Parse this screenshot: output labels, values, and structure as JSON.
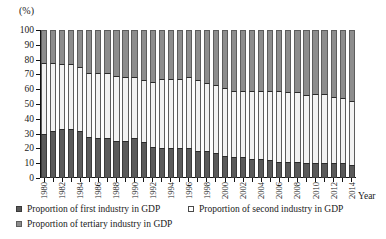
{
  "chart_data": {
    "type": "bar",
    "subtype": "100% stacked bar",
    "title": "",
    "xlabel": "Year",
    "ylabel": "(%)",
    "ylim": [
      0,
      100
    ],
    "yticks": [
      100,
      90,
      80,
      70,
      60,
      50,
      40,
      30,
      20,
      10,
      0
    ],
    "grid": false,
    "legend_position": "bottom",
    "x": [
      1980,
      1981,
      1982,
      1983,
      1984,
      1985,
      1986,
      1987,
      1988,
      1989,
      1990,
      1991,
      1992,
      1993,
      1994,
      1995,
      1996,
      1997,
      1998,
      1999,
      2000,
      2001,
      2002,
      2003,
      2004,
      2005,
      2006,
      2007,
      2008,
      2009,
      2010,
      2011,
      2012,
      2013,
      2014
    ],
    "tick_labels": [
      "1980",
      "1982",
      "1984",
      "1986",
      "1988",
      "1990",
      "1992",
      "1994",
      "1996",
      "1998",
      "2000",
      "2002",
      "2004",
      "2006",
      "2008",
      "2010",
      "2012",
      "2014"
    ],
    "tick_label_interval": 2,
    "series": [
      {
        "name": "Proportion of first industry in GDP",
        "color": "#5a5a5a",
        "values": [
          30,
          32,
          33,
          33,
          32,
          28,
          27,
          27,
          25,
          25,
          27,
          24,
          21,
          20,
          20,
          20,
          20,
          18,
          18,
          17,
          15,
          14,
          14,
          13,
          13,
          12,
          11,
          11,
          11,
          10,
          10,
          10,
          10,
          10,
          9
        ]
      },
      {
        "name": "Proportion of second industry in GDP",
        "color": "#f2f2f2",
        "values": [
          48,
          46,
          44,
          44,
          43,
          43,
          44,
          44,
          44,
          43,
          41,
          42,
          44,
          47,
          47,
          47,
          48,
          48,
          46,
          46,
          46,
          45,
          45,
          46,
          46,
          47,
          48,
          47,
          47,
          46,
          47,
          47,
          45,
          44,
          43
        ]
      },
      {
        "name": "Proportion of tertiary industry in GDP",
        "color": "#8d8d8d",
        "values": [
          22,
          22,
          23,
          23,
          25,
          29,
          29,
          29,
          31,
          32,
          32,
          34,
          35,
          33,
          33,
          33,
          32,
          34,
          36,
          37,
          39,
          41,
          41,
          41,
          41,
          41,
          41,
          42,
          42,
          44,
          43,
          43,
          45,
          46,
          48
        ]
      }
    ]
  },
  "axes": {
    "y_unit_label": "(%)",
    "x_axis_title": "Year"
  },
  "legend": {
    "items": [
      {
        "label": "Proportion of first industry in GDP",
        "swatch": "first-industry-swatch"
      },
      {
        "label": "Proportion of second industry in GDP",
        "swatch": "second-industry-swatch"
      },
      {
        "label": "Proportion of tertiary industry in GDP",
        "swatch": "tertiary-industry-swatch"
      }
    ]
  }
}
